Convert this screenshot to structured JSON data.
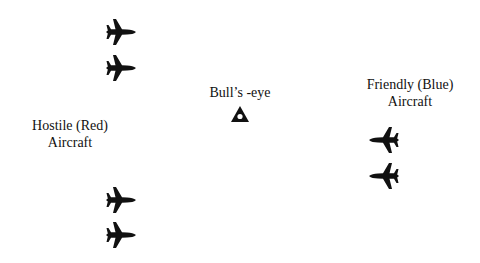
{
  "labels": {
    "hostile_line1": "Hostile (Red)",
    "hostile_line2": "Aircraft",
    "bullseye": "Bull’s -eye",
    "friendly_line1": "Friendly (Blue)",
    "friendly_line2": "Aircraft"
  },
  "groups": {
    "hostile": {
      "color_name": "red",
      "heading": "east",
      "icon": "fighter-jet-icon",
      "count": 4
    },
    "friendly": {
      "color_name": "blue",
      "heading": "west",
      "icon": "fighter-jet-icon",
      "count": 2
    }
  },
  "reference": {
    "icon": "bullseye-triangle-icon"
  },
  "colors": {
    "ink": "#111111",
    "background": "#ffffff"
  }
}
